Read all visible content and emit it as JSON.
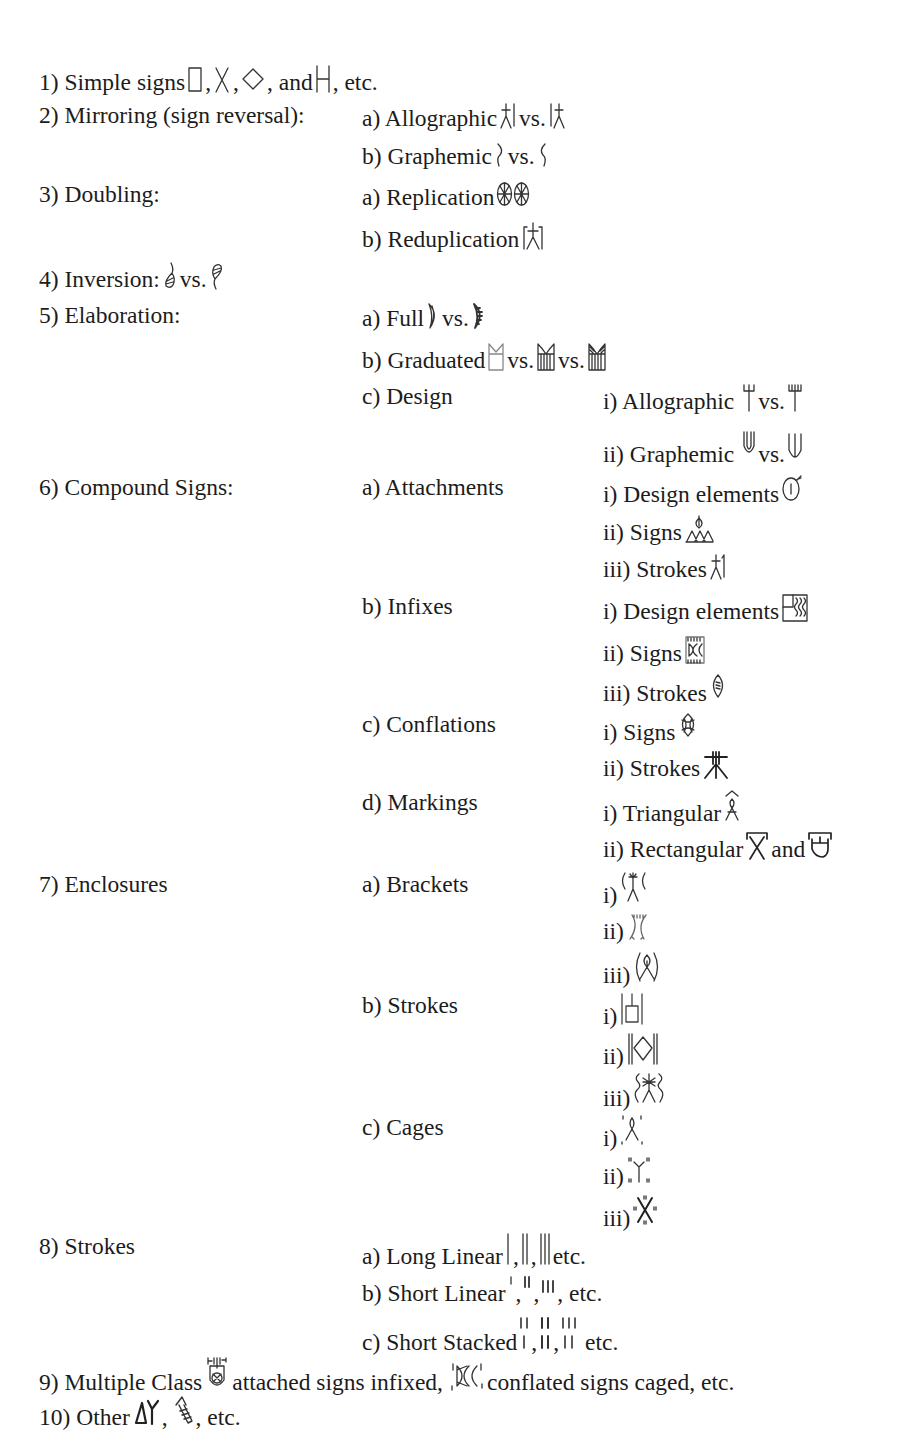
{
  "classification": [
    {
      "id": "1",
      "label": "1) Simple signs",
      "signs": [
        "box-sign",
        "x-sign",
        "diamond-sign",
        "h-sign"
      ],
      "suffix": "etc."
    },
    {
      "id": "2",
      "label": "2) Mirroring (sign reversal):",
      "sub": [
        {
          "label": "a) Allographic",
          "text_between": "vs.",
          "signs": [
            "man-pole-sign",
            "pole-man-sign"
          ]
        },
        {
          "label": "b) Graphemic",
          "text_between": "vs.",
          "signs": [
            "bracket-right-sign",
            "bracket-left-sign"
          ]
        }
      ]
    },
    {
      "id": "3",
      "label": "3) Doubling:",
      "sub": [
        {
          "label": "a) Replication",
          "signs": [
            "double-wheel-sign"
          ]
        },
        {
          "label": "b) Reduplication",
          "signs": [
            "poles-man-sign"
          ]
        }
      ]
    },
    {
      "id": "4",
      "label": "4) Inversion:",
      "text_between": "vs.",
      "signs": [
        "fish-sign",
        "inverted-fish-sign"
      ]
    },
    {
      "id": "5",
      "label": "5) Elaboration:",
      "sub": [
        {
          "label": "a) Full",
          "text_between": "vs.",
          "signs": [
            "crescent-sign",
            "hatched-crescent-sign"
          ]
        },
        {
          "label": "b) Graduated",
          "text_between": "vs.",
          "signs": [
            "jar-sign",
            "hatched-jar-sign",
            "full-hatched-jar-sign"
          ]
        },
        {
          "label": "c) Design",
          "sub": [
            {
              "label": "i) Allographic",
              "text_between": "vs.",
              "signs": [
                "trident-sign",
                "trident-variant-sign"
              ]
            },
            {
              "label": "ii) Graphemic",
              "text_between": "vs.",
              "signs": [
                "u-sign",
                "u-variant-sign"
              ]
            }
          ]
        }
      ]
    },
    {
      "id": "6",
      "label": "6) Compound Signs:",
      "sub": [
        {
          "label": "a) Attachments",
          "sub": [
            {
              "label": "i) Design elements",
              "signs": [
                "oval-attach-sign"
              ]
            },
            {
              "label": "ii) Signs",
              "signs": [
                "leaf-triangles-sign"
              ]
            },
            {
              "label": "iii) Strokes",
              "signs": [
                "man-stroke-sign"
              ]
            }
          ]
        },
        {
          "label": "b) Infixes",
          "sub": [
            {
              "label": "i) Design elements",
              "signs": [
                "square-waves-sign"
              ]
            },
            {
              "label": "ii) Signs",
              "signs": [
                "box-infix-sign"
              ]
            },
            {
              "label": "iii) Strokes",
              "signs": [
                "oval-strokes-sign"
              ]
            }
          ]
        },
        {
          "label": "c) Conflations",
          "sub": [
            {
              "label": "i) Signs",
              "signs": [
                "oval-cross-sign"
              ]
            },
            {
              "label": "ii) Strokes",
              "signs": [
                "asterisk-sign"
              ]
            }
          ]
        },
        {
          "label": "d) Markings",
          "sub": [
            {
              "label": "i) Triangular",
              "signs": [
                "hat-figure-sign"
              ]
            },
            {
              "label": "ii) Rectangular",
              "text_between": "and",
              "signs": [
                "bar-x-sign",
                "bar-cup-sign"
              ]
            }
          ]
        }
      ]
    },
    {
      "id": "7",
      "label": "7) Enclosures",
      "sub": [
        {
          "label": "a) Brackets",
          "sub": [
            {
              "label": "i)",
              "signs": [
                "bracketed-man-sign"
              ]
            },
            {
              "label": "ii)",
              "signs": [
                "bracketed-empty-sign"
              ]
            },
            {
              "label": "iii)",
              "signs": [
                "bracketed-fish-sign"
              ]
            }
          ]
        },
        {
          "label": "b) Strokes",
          "sub": [
            {
              "label": "i)",
              "signs": [
                "stroked-box-sign"
              ]
            },
            {
              "label": "ii)",
              "signs": [
                "stroked-diamond-sign"
              ]
            },
            {
              "label": "iii)",
              "signs": [
                "stroked-man-sign"
              ]
            }
          ]
        },
        {
          "label": "c) Cages",
          "sub": [
            {
              "label": "i)",
              "signs": [
                "caged-figure-sign"
              ]
            },
            {
              "label": "ii)",
              "signs": [
                "caged-y-sign"
              ]
            },
            {
              "label": "iii)",
              "signs": [
                "caged-x-sign"
              ]
            }
          ]
        }
      ]
    },
    {
      "id": "8",
      "label": "8) Strokes",
      "sub": [
        {
          "label": "a) Long Linear",
          "signs": [
            "long-1-sign",
            "long-2-sign",
            "long-3-sign"
          ],
          "suffix": "etc."
        },
        {
          "label": "b) Short Linear",
          "signs": [
            "short-1-sign",
            "short-2-sign",
            "short-3-sign"
          ],
          "suffix": "etc."
        },
        {
          "label": "c) Short Stacked",
          "signs": [
            "stacked-1-sign",
            "stacked-2-sign",
            "stacked-3-sign"
          ],
          "suffix": "etc."
        }
      ]
    },
    {
      "id": "9",
      "label": "9) Multiple Class",
      "parts": [
        "attached signs infixed,",
        "conflated signs caged, etc."
      ],
      "signs": [
        "multi-jar-sign",
        "caged-conflated-sign"
      ]
    },
    {
      "id": "10",
      "label": "10) Other",
      "signs": [
        "other-1-sign",
        "other-2-sign"
      ],
      "suffix": "etc."
    }
  ],
  "text": {
    "l1": "1) Simple signs",
    "l1_and": ", and",
    "l1_etc": ", etc.",
    "l2": "2) Mirroring (sign reversal):",
    "l2a": "a) Allographic",
    "l2b": "b) Graphemic",
    "l3": "3) Doubling:",
    "l3a": "a) Replication",
    "l3b": "b) Reduplication",
    "l4": "4) Inversion:",
    "l5": "5) Elaboration:",
    "l5a": "a) Full",
    "l5b": "b) Graduated",
    "l5c": "c) Design",
    "l5ci": "i) Allographic",
    "l5cii": "ii) Graphemic",
    "l6": "6) Compound Signs:",
    "l6a": "a) Attachments",
    "l6ai": "i) Design elements",
    "l6aii": "ii) Signs",
    "l6aiii": "iii) Strokes",
    "l6b": "b) Infixes",
    "l6bi": "i) Design elements",
    "l6bii": "ii) Signs",
    "l6biii": "iii) Strokes",
    "l6c": "c) Conflations",
    "l6ci": "i) Signs",
    "l6cii": "ii) Strokes",
    "l6d": "d) Markings",
    "l6di": "i) Triangular",
    "l6dii": "ii) Rectangular",
    "l7": "7) Enclosures",
    "l7a": "a) Brackets",
    "l7b": "b) Strokes",
    "l7c": "c) Cages",
    "r_i": "i)",
    "r_ii": "ii)",
    "r_iii": "iii)",
    "l8": "8) Strokes",
    "l8a": "a) Long Linear",
    "l8b": "b) Short Linear",
    "l8c": "c) Short Stacked",
    "l9": "9) Multiple Class",
    "l9_mid": "attached signs infixed,",
    "l9_end": "conflated signs caged, etc.",
    "l10": "10) Other",
    "vs": "vs.",
    "and": "and",
    "comma": ",",
    "etc": "etc.",
    "comma_etc": ", etc."
  }
}
